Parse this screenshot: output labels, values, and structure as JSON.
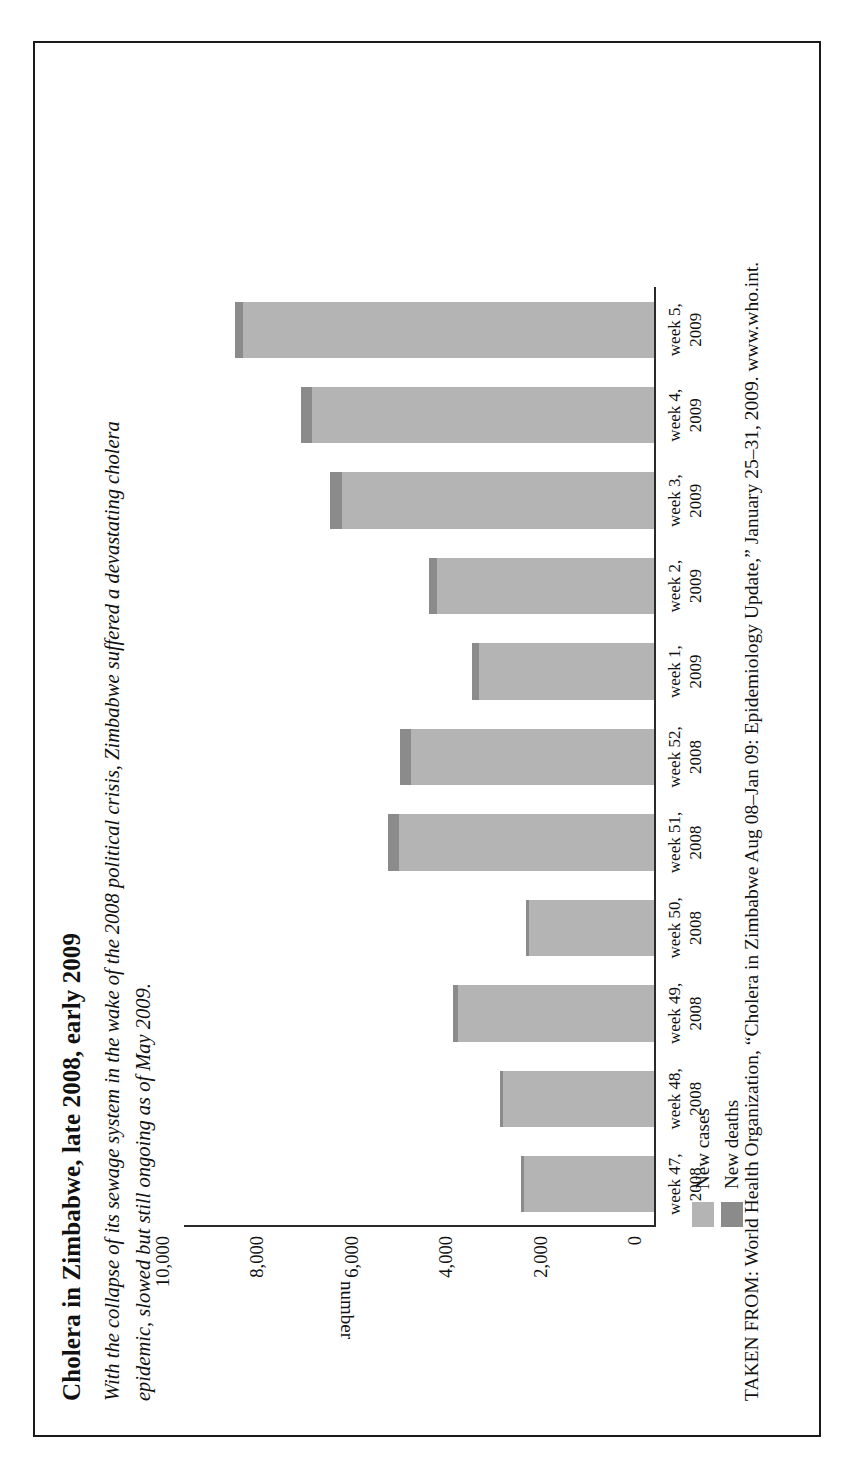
{
  "figure": {
    "title": "Cholera in Zimbabwe, late 2008, early 2009",
    "subtitle_line1": "With the collapse of its sewage system in the wake of the 2008 political crisis, Zimbabwe suffered a devastating cholera",
    "subtitle_line2": "epidemic, slowed but still ongoing as of May 2009.",
    "source": "TAKEN FROM: World Health Organization, “Cholera in Zimbabwe Aug 08–Jan 09: Epidemiology Update,” January 25–31, 2009. www.who.int."
  },
  "colors": {
    "new_cases": "#b4b4b4",
    "new_deaths": "#8b8b8b",
    "axis": "#2a2a2a",
    "text": "#111111",
    "frame": "#1a1a1a",
    "page": "#ffffff"
  },
  "chart_data": {
    "type": "bar",
    "orientation": "vertical",
    "stacked": true,
    "title": "Cholera in Zimbabwe, late 2008, early 2009",
    "xlabel": "",
    "ylabel": "number",
    "ylim": [
      0,
      10000
    ],
    "yticks": [
      0,
      2000,
      4000,
      6000,
      8000,
      10000
    ],
    "ytick_labels": [
      "0",
      "2,000",
      "4,000",
      "6,000",
      "8,000",
      "10,000"
    ],
    "grid": false,
    "legend_position": "below-left",
    "categories": [
      "week 47, 2008",
      "week 48, 2008",
      "week 49, 2008",
      "week 50, 2008",
      "week 51, 2008",
      "week 52, 2008",
      "week 1, 2009",
      "week 2, 2009",
      "week 3, 2009",
      "week 4, 2009",
      "week 5, 2009"
    ],
    "category_lines": [
      [
        "week 47,",
        "2008"
      ],
      [
        "week 48,",
        "2008"
      ],
      [
        "week 49,",
        "2008"
      ],
      [
        "week 50,",
        "2008"
      ],
      [
        "week 51,",
        "2008"
      ],
      [
        "week 52,",
        "2008"
      ],
      [
        "week 1,",
        "2009"
      ],
      [
        "week 2,",
        "2009"
      ],
      [
        "week 3,",
        "2009"
      ],
      [
        "week 4,",
        "2009"
      ],
      [
        "week 5,",
        "2009"
      ]
    ],
    "series": [
      {
        "name": "New cases",
        "color": "#b4b4b4",
        "values": [
          2750,
          3200,
          4150,
          2650,
          5400,
          5150,
          3700,
          4600,
          6600,
          7250,
          8700
        ]
      },
      {
        "name": "New deaths",
        "color": "#8b8b8b",
        "values": [
          60,
          70,
          110,
          70,
          240,
          230,
          150,
          160,
          260,
          230,
          170
        ]
      }
    ]
  },
  "legend": {
    "items": [
      {
        "label": "New cases",
        "color": "#b4b4b4"
      },
      {
        "label": "New deaths",
        "color": "#8b8b8b"
      }
    ]
  }
}
